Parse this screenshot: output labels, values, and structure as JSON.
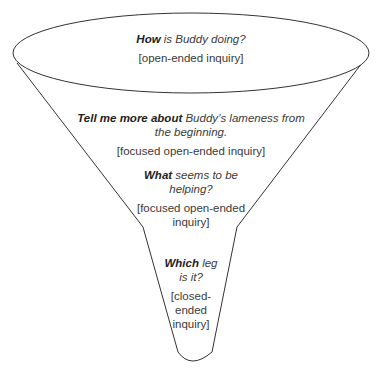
{
  "diagram": {
    "colors": {
      "outline": "#333333",
      "text": "#3a3a3a",
      "background": "#ffffff"
    },
    "stages": [
      {
        "question_bold": "How",
        "question_rest": " is Buddy doing?",
        "type": "[open-ended inquiry]"
      },
      {
        "question_bold": "Tell me more about",
        "question_rest": " Buddy’s lameness from the beginning.",
        "type": "[focused open-ended inquiry]"
      },
      {
        "question_bold": "What",
        "question_rest": " seems to be helping?",
        "type": "[focused open-ended inquiry]"
      },
      {
        "question_bold": "Which",
        "question_rest": " leg is it?",
        "type": "[closed-ended inquiry]"
      }
    ]
  }
}
